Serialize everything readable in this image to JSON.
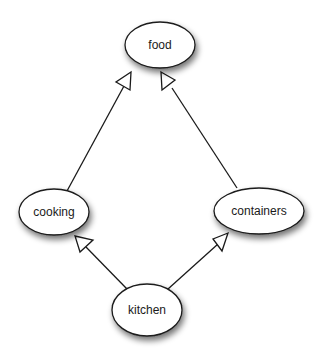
{
  "diagram": {
    "type": "directed-graph",
    "nodes": [
      {
        "id": "food",
        "label": "food"
      },
      {
        "id": "cooking",
        "label": "cooking"
      },
      {
        "id": "containers",
        "label": "containers"
      },
      {
        "id": "kitchen",
        "label": "kitchen"
      }
    ],
    "edges": [
      {
        "from": "cooking",
        "to": "food",
        "arrowhead": "hollow-triangle"
      },
      {
        "from": "containers",
        "to": "food",
        "arrowhead": "hollow-triangle"
      },
      {
        "from": "kitchen",
        "to": "cooking",
        "arrowhead": "hollow-triangle"
      },
      {
        "from": "kitchen",
        "to": "containers",
        "arrowhead": "hollow-triangle"
      }
    ]
  },
  "colors": {
    "background": "#ffffff",
    "stroke": "#1a1a1a",
    "node_fill": "#ffffff",
    "shadow": "#777777"
  }
}
